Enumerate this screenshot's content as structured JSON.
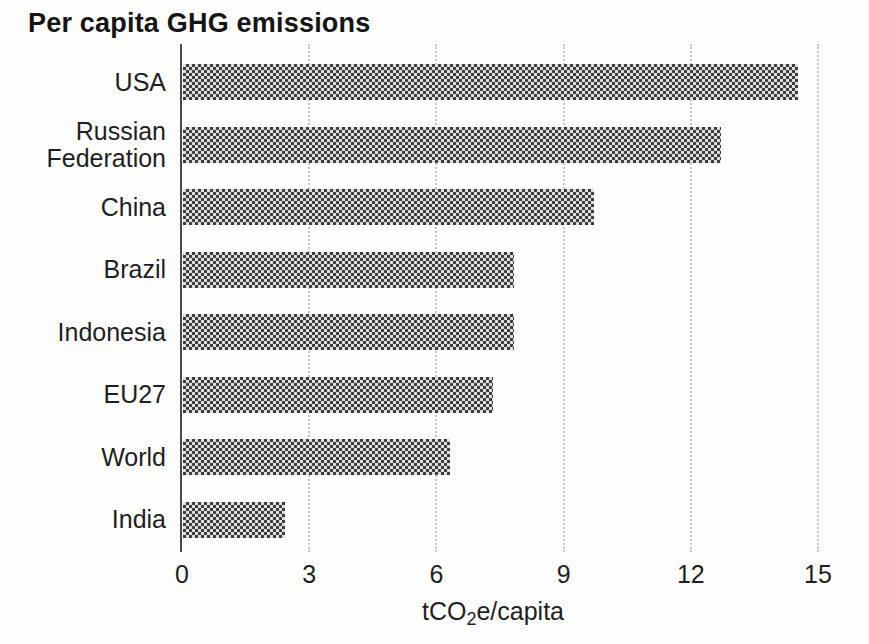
{
  "title": "Per capita GHG emissions",
  "chart_data": {
    "type": "bar",
    "orientation": "horizontal",
    "title": "Per capita GHG emissions",
    "categories": [
      "USA",
      "Russian Federation",
      "China",
      "Brazil",
      "Indonesia",
      "EU27",
      "World",
      "India"
    ],
    "values": [
      14.5,
      12.7,
      9.7,
      7.8,
      7.8,
      7.3,
      6.3,
      2.4
    ],
    "xlabel": "tCO2e/capita",
    "xlabel_parts": {
      "prefix": "tCO",
      "sub": "2",
      "suffix": "e/capita"
    },
    "xlim": [
      0,
      15
    ],
    "xticks": [
      0,
      3,
      6,
      9,
      12,
      15
    ],
    "grid": "vertical dotted gridlines at x ticks",
    "legend": "none",
    "bar_pattern": "checkerboard",
    "colors": {
      "bar_dark": "#3d3d3d",
      "bar_light": "#dedede",
      "gridline": "#c6c6c6",
      "axis": "#4a4a4a",
      "text": "#1f1f1f",
      "background": "#fdfdfc"
    }
  }
}
